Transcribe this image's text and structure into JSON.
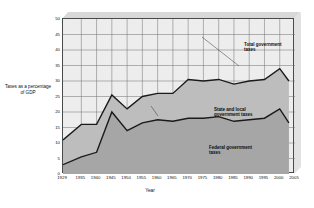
{
  "axes": {
    "ylabel": "Taxes\nas a\npercentage\nof GDP",
    "xlabel": "Year"
  },
  "annotations": {
    "total": "Total government\ntaxes",
    "state_local": "State and local\ngovernment taxes",
    "federal": "Federal government\ntaxes"
  },
  "colors": {
    "federal_fill": "#a6a6a6",
    "state_local_fill": "#bdbdbd",
    "plot_background": "#ededed",
    "line": "#1a1a1a",
    "grid": "#6e6e6e",
    "frame_3d": "#d8d8d8"
  },
  "chart_data": {
    "type": "area",
    "stacked": true,
    "title": "",
    "subtitle": "",
    "xlabel": "Year",
    "ylabel": "Taxes as a percentage of GDP",
    "xlim": [
      1929,
      2005
    ],
    "ylim": [
      0,
      50
    ],
    "ytick_step": 5,
    "grid": true,
    "legend": "annotations-in-plot",
    "xticks": [
      1929,
      1935,
      1940,
      1945,
      1950,
      1955,
      1960,
      1965,
      1970,
      1975,
      1980,
      1985,
      1990,
      1995,
      2000,
      2005
    ],
    "yticks": [
      0,
      5,
      10,
      15,
      20,
      25,
      30,
      35,
      40,
      45,
      50
    ],
    "x": [
      1929,
      1935,
      1940,
      1945,
      1950,
      1955,
      1960,
      1965,
      1970,
      1975,
      1980,
      1985,
      1990,
      1995,
      2000,
      2003
    ],
    "series": [
      {
        "name": "Federal government taxes",
        "values": [
          3,
          5.5,
          7,
          20,
          14,
          16.5,
          17.5,
          17,
          18,
          18,
          18.5,
          17,
          17.5,
          18,
          21,
          16.5
        ]
      },
      {
        "name": "State and local government taxes",
        "values": [
          8,
          10.5,
          9,
          5.5,
          7,
          8.5,
          8.5,
          9,
          12.5,
          12,
          12,
          12,
          12.5,
          12.5,
          13,
          13.5
        ]
      }
    ],
    "total_series": {
      "name": "Total government taxes",
      "values": [
        11,
        16,
        16,
        25.5,
        21,
        25,
        26,
        26,
        30.5,
        30,
        30.5,
        29,
        30,
        30.5,
        34,
        30
      ]
    }
  }
}
